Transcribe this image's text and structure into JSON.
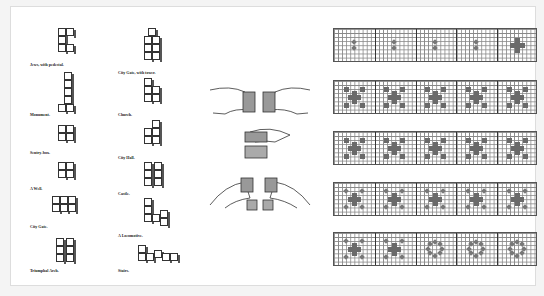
{
  "plate": {
    "left_column_labels": [
      "Jews, with pedestal.",
      "Monument.",
      "Sentry-box.",
      "A Well.",
      "City Gate.",
      "Triumphal Arch."
    ],
    "right_column_labels": [
      "City Gate, with tower.",
      "Church.",
      "City Hall.",
      "Castle.",
      "A Locomotive.",
      "Stairs."
    ],
    "hand_figures": [
      "hands-dividing-cube",
      "hands-lifting-cube",
      "hands-separating-halves"
    ],
    "pattern_strips": [
      {
        "row": 1,
        "panels": 5
      },
      {
        "row": 2,
        "panels": 5
      },
      {
        "row": 3,
        "panels": 5
      },
      {
        "row": 4,
        "panels": 5
      },
      {
        "row": 5,
        "panels": 5
      }
    ]
  }
}
